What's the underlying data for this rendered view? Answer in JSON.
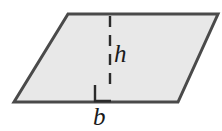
{
  "figure": {
    "kind": "geometry-diagram",
    "shape_name": "parallelogram",
    "background_color": "#ffffff",
    "fill_color": "#e8e8e8",
    "stroke_color": "#4a4a4a",
    "stroke_width": 3,
    "labels": {
      "height_label": "h",
      "base_label": "b"
    },
    "markers": {
      "right_angle_label": "right-angle-marker",
      "dashed_line_label": "height-dashed-line"
    },
    "geometry": {
      "vertices": [
        {
          "name": "top-left",
          "x": 68,
          "y": 14
        },
        {
          "name": "top-right",
          "x": 218,
          "y": 14
        },
        {
          "name": "bottom-right",
          "x": 178,
          "y": 102
        },
        {
          "name": "bottom-left",
          "x": 14,
          "y": 102
        }
      ],
      "height_line": {
        "x": 110,
        "y_top": 16,
        "y_bottom": 85
      },
      "right_angle_square": {
        "x": 95,
        "y": 85,
        "size": 16
      },
      "dash_pattern": "11 8"
    }
  }
}
